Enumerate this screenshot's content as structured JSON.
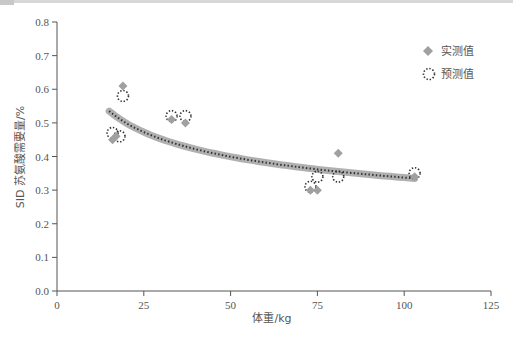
{
  "chart_data": {
    "type": "scatter",
    "title": "",
    "xlabel": "体重/kg",
    "ylabel": "SID 苏氨酸需要量/%",
    "xlim": [
      0,
      125
    ],
    "ylim": [
      0.0,
      0.8
    ],
    "xticks": [
      "0",
      "25",
      "50",
      "75",
      "100",
      "125"
    ],
    "yticks": [
      "0.0",
      "0.1",
      "0.2",
      "0.3",
      "0.4",
      "0.5",
      "0.6",
      "0.7",
      "0.8"
    ],
    "grid": false,
    "legend_position": "upper right",
    "series": [
      {
        "name": "实测值",
        "marker": "diamond",
        "color": "#a0a0a0",
        "points": [
          [
            16,
            0.45
          ],
          [
            17,
            0.46
          ],
          [
            19,
            0.61
          ],
          [
            33,
            0.51
          ],
          [
            37,
            0.5
          ],
          [
            73,
            0.3
          ],
          [
            75,
            0.3
          ],
          [
            81,
            0.41
          ],
          [
            103,
            0.34
          ]
        ]
      },
      {
        "name": "预测值",
        "marker": "dotted-circle",
        "color": "#333333",
        "points": [
          [
            16,
            0.47
          ],
          [
            18,
            0.46
          ],
          [
            19,
            0.58
          ],
          [
            33,
            0.52
          ],
          [
            37,
            0.52
          ],
          [
            73,
            0.31
          ],
          [
            75,
            0.34
          ],
          [
            81,
            0.34
          ],
          [
            103,
            0.35
          ]
        ]
      },
      {
        "name": "拟合曲线",
        "type": "line",
        "color": "#b0b0b0",
        "x_range": [
          15,
          103
        ],
        "y_at_start": 0.535,
        "y_at_end": 0.335
      }
    ]
  },
  "legend": {
    "measured": "实测值",
    "predicted": "预测值"
  },
  "axes": {
    "xlabel": "体重/kg",
    "ylabel": "SID 苏氨酸需要量/%"
  }
}
